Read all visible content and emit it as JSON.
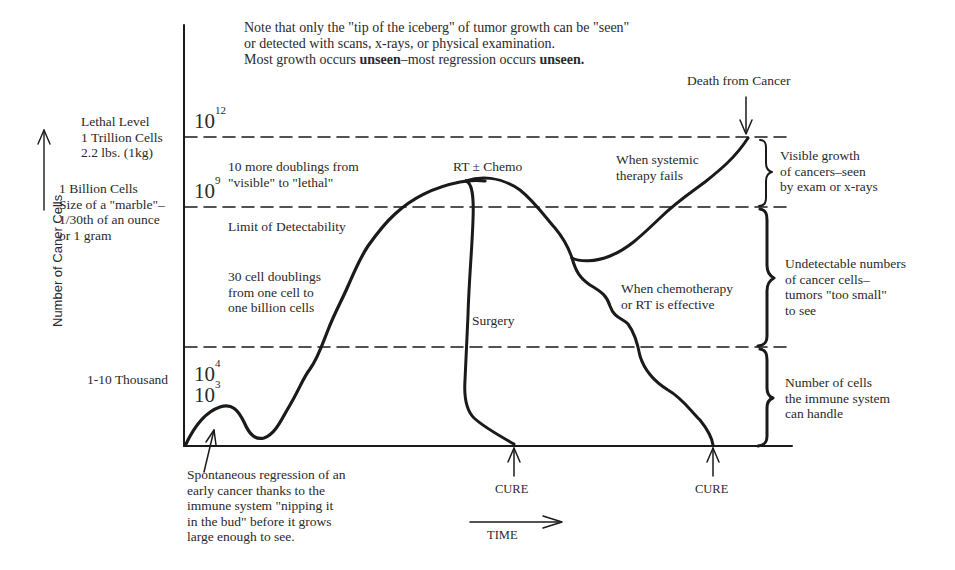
{
  "note": {
    "line1": "Note that only the \"tip of the iceberg\" of tumor growth can be \"seen\"",
    "line2": "or detected with scans, x-rays, or physical examination.",
    "line3_pre": "Most growth occurs ",
    "line3_bold1": "unseen",
    "line3_mid": "–most regression occurs ",
    "line3_bold2": "unseen."
  },
  "y_axis": {
    "label": "Number of Caner Cells",
    "levels": [
      {
        "power_base": "10",
        "power_exp": "12",
        "desc": [
          "Lethal Level",
          "1 Trillion Cells",
          "2.2 lbs. (1kg)"
        ]
      },
      {
        "power_base": "10",
        "power_exp": "9",
        "desc": [
          "1 Billion Cells",
          "Size of a \"marble\"–",
          "1/30th of an ounce",
          "or 1 gram"
        ]
      },
      {
        "power_base": "10",
        "power_exp": "4",
        "power_base2": "10",
        "power_exp2": "3",
        "desc": [
          "1-10 Thousand"
        ]
      }
    ]
  },
  "x_axis": {
    "label": "TIME"
  },
  "annotations": {
    "doublings_10": [
      "10 more doublings from",
      "\"visible\" to \"lethal\""
    ],
    "limit": "Limit of Detectability",
    "doublings_30": [
      "30 cell doublings",
      "from one cell  to",
      "one billion cells"
    ],
    "rt_chemo": "RT ± Chemo",
    "surgery": "Surgery",
    "systemic_fails": [
      "When systemic",
      "therapy fails"
    ],
    "chemo_effective": [
      "When chemotherapy",
      "or RT is effective"
    ],
    "death": "Death from Cancer",
    "cure1": "CURE",
    "cure2": "CURE",
    "regression": [
      "Spontaneous regression of an",
      "early cancer thanks to the",
      "immune system \"nipping it",
      "in the bud\" before it grows",
      "large enough to see."
    ]
  },
  "brackets": {
    "visible": [
      "Visible growth",
      "of cancers–seen",
      "by exam or x-rays"
    ],
    "undetectable": [
      "Undetectable numbers",
      "of cancer cells–",
      "tumors \"too small\"",
      "to see"
    ],
    "immune": [
      "Number of cells",
      "the immune system",
      "can handle"
    ]
  }
}
